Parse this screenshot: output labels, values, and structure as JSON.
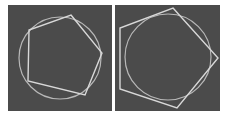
{
  "figure": {
    "panels": [
      {
        "id": "inscribed",
        "description": "Regular pentagon inscribed in a circle",
        "circle": {
          "cx": 52,
          "cy": 53,
          "r": 41
        },
        "pentagon": "63,10 94,48 77,90 20,76 21,25",
        "colors": {
          "background": "#4b4b4b",
          "circle": "#b8b8b8",
          "pentagon": "#d8d8d8"
        }
      },
      {
        "id": "circumscribed",
        "description": "Regular pentagon circumscribed about a circle",
        "circle": {
          "cx": 53,
          "cy": 52,
          "r": 43
        },
        "pentagon": "58,3 103,53 62,103 5,84 5,23",
        "colors": {
          "background": "#4b4b4b",
          "circle": "#b8b8b8",
          "pentagon": "#d8d8d8"
        }
      }
    ]
  }
}
